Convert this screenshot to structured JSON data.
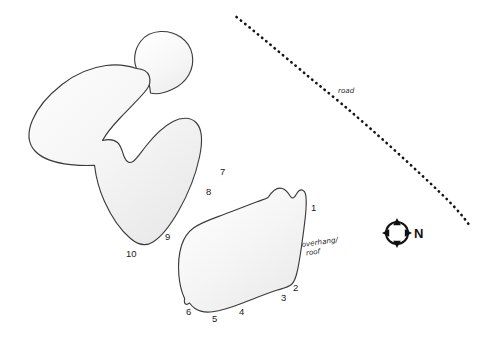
{
  "figure": {
    "kind": "archaeological-site-sketch-map",
    "background_color": "#ffffff",
    "width": 491,
    "height": 343,
    "outline_color": "#3b3b3b",
    "fill_light": "#fdfdfd",
    "fill_shade": "#eeeeee"
  },
  "features": [
    {
      "id": "rockshelter-north",
      "name": "northern-rockshelter-outline",
      "labels": [
        "7",
        "8",
        "9",
        "10"
      ]
    },
    {
      "id": "rockshelter-south",
      "name": "southern-rockshelter-outline",
      "labels": [
        "1",
        "2",
        "3",
        "4",
        "5",
        "6"
      ]
    }
  ],
  "point_labels": [
    {
      "text": "1",
      "x": 311,
      "y": 211
    },
    {
      "text": "2",
      "x": 293,
      "y": 291
    },
    {
      "text": "3",
      "x": 281,
      "y": 301
    },
    {
      "text": "4",
      "x": 239,
      "y": 315
    },
    {
      "text": "5",
      "x": 212,
      "y": 322
    },
    {
      "text": "6",
      "x": 186,
      "y": 315
    },
    {
      "text": "7",
      "x": 220,
      "y": 175
    },
    {
      "text": "8",
      "x": 206,
      "y": 195
    },
    {
      "text": "9",
      "x": 165,
      "y": 240
    },
    {
      "text": "10",
      "x": 126,
      "y": 257
    }
  ],
  "annotations": [
    {
      "name": "road-label",
      "text": "road",
      "x": 338,
      "y": 93,
      "rotation": 0
    },
    {
      "name": "overhang-roof-label",
      "line1": "overhang/",
      "line2": "roof",
      "x": 302,
      "y": 247,
      "rotation": -8
    }
  ],
  "road": {
    "name": "road-dotted-line",
    "style": "dotted",
    "color": "#141414"
  },
  "compass": {
    "name": "north-arrow",
    "letter": "N",
    "cx": 397,
    "cy": 233,
    "radius": 11
  }
}
